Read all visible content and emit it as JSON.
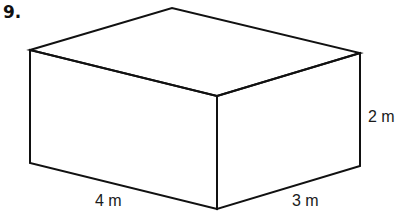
{
  "problem": {
    "number": "9."
  },
  "figure": {
    "type": "rectangular-prism",
    "labels": {
      "length": "4 m",
      "width": "3 m",
      "height": "2 m"
    },
    "stroke_color": "#111111"
  }
}
